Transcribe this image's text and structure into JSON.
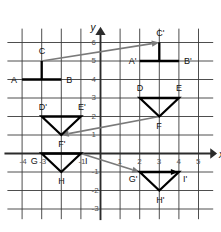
{
  "figure": {
    "type": "coordinate-plane-transformation-diagram",
    "axes": {
      "x_name": "x",
      "y_name": "y",
      "x_ticks": [
        "-4",
        "-3",
        "-1",
        "1",
        "2",
        "3",
        "4",
        "5"
      ],
      "x_tick_values": [
        -4,
        -3,
        -1,
        1,
        2,
        3,
        4,
        5
      ],
      "y_ticks": [
        "6",
        "5",
        "4",
        "3",
        "2",
        "1",
        "-1",
        "-2",
        "-3"
      ],
      "y_tick_values": [
        6,
        5,
        4,
        3,
        2,
        1,
        -1,
        -2,
        -3
      ],
      "xlim": [
        -4.8,
        5.8
      ],
      "ylim": [
        -3.6,
        6.8
      ],
      "grid": true,
      "grid_color": "#3a3a3a",
      "axis_color": "#2b2b2b"
    },
    "shapes": [
      {
        "name": "figure-abc",
        "kind": "polyline",
        "stroke": "#000000",
        "points": [
          [
            -4,
            4
          ],
          [
            -3,
            4
          ],
          [
            -3,
            5
          ],
          [
            -3,
            4
          ],
          [
            -2,
            4
          ]
        ],
        "vertices": [
          {
            "label": "A",
            "x": -4,
            "y": 4,
            "anchor": "left"
          },
          {
            "label": "B",
            "x": -2,
            "y": 4,
            "anchor": "right"
          },
          {
            "label": "C",
            "x": -3,
            "y": 5,
            "anchor": "above"
          }
        ]
      },
      {
        "name": "figure-abc-prime",
        "kind": "polyline",
        "stroke": "#000000",
        "points": [
          [
            2,
            5
          ],
          [
            3,
            5
          ],
          [
            3,
            6
          ],
          [
            3,
            5
          ],
          [
            4,
            5
          ]
        ],
        "vertices": [
          {
            "label": "A'",
            "x": 2,
            "y": 5,
            "anchor": "left"
          },
          {
            "label": "B'",
            "x": 4,
            "y": 5,
            "anchor": "right"
          },
          {
            "label": "C'",
            "x": 3,
            "y": 6,
            "anchor": "above"
          }
        ]
      },
      {
        "name": "triangle-def",
        "kind": "polygon",
        "stroke": "#000000",
        "points": [
          [
            2,
            3
          ],
          [
            4,
            3
          ],
          [
            3,
            2
          ]
        ],
        "vertices": [
          {
            "label": "D",
            "x": 2,
            "y": 3,
            "anchor": "above"
          },
          {
            "label": "E",
            "x": 4,
            "y": 3,
            "anchor": "above"
          },
          {
            "label": "F",
            "x": 3,
            "y": 2,
            "anchor": "below"
          }
        ]
      },
      {
        "name": "triangle-def-prime",
        "kind": "polygon",
        "stroke": "#000000",
        "points": [
          [
            -3,
            2
          ],
          [
            -1,
            2
          ],
          [
            -2,
            1
          ]
        ],
        "vertices": [
          {
            "label": "D'",
            "x": -3,
            "y": 2,
            "anchor": "above"
          },
          {
            "label": "E'",
            "x": -1,
            "y": 2,
            "anchor": "above"
          },
          {
            "label": "F'",
            "x": -2,
            "y": 1,
            "anchor": "below"
          }
        ]
      },
      {
        "name": "triangle-ghi",
        "kind": "polygon",
        "stroke": "#000000",
        "points": [
          [
            -3,
            0
          ],
          [
            -1,
            0
          ],
          [
            -2,
            -1
          ]
        ],
        "vertices": [
          {
            "label": "G",
            "x": -3,
            "y": 0,
            "anchor": "below-left"
          },
          {
            "label": "I",
            "x": -1,
            "y": 0,
            "anchor": "below-right"
          },
          {
            "label": "H",
            "x": -2,
            "y": -1,
            "anchor": "below"
          }
        ]
      },
      {
        "name": "triangle-ghi-prime",
        "kind": "polygon",
        "stroke": "#000000",
        "arrowhead_on_top_edge": true,
        "points": [
          [
            2,
            -1
          ],
          [
            4,
            -1
          ],
          [
            3,
            -2
          ]
        ],
        "vertices": [
          {
            "label": "G'",
            "x": 2,
            "y": -1,
            "anchor": "below-left"
          },
          {
            "label": "I'",
            "x": 4,
            "y": -1,
            "anchor": "below-right"
          },
          {
            "label": "H'",
            "x": 3,
            "y": -2,
            "anchor": "below"
          }
        ]
      }
    ],
    "mapping_arrows": [
      {
        "name": "arrow-c-to-c-prime",
        "from": [
          -3,
          5
        ],
        "to": [
          3,
          6
        ],
        "color": "#7a7a7a"
      },
      {
        "name": "arrow-f-to-f-prime",
        "from": [
          3,
          2
        ],
        "to": [
          -2,
          1
        ],
        "color": "#7a7a7a"
      },
      {
        "name": "arrow-i-to-g-prime",
        "from": [
          -1,
          0
        ],
        "to": [
          2,
          -1
        ],
        "color": "#7a7a7a"
      }
    ]
  }
}
